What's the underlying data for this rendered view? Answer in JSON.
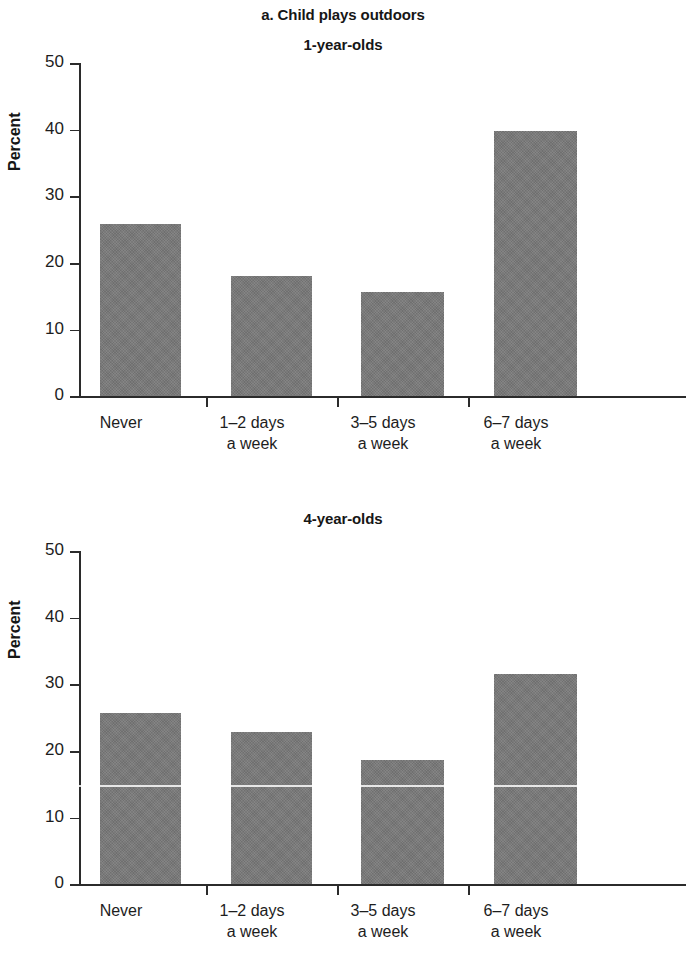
{
  "figure": {
    "title": "a. Child plays outdoors"
  },
  "panels": [
    {
      "title": "1-year-olds",
      "ylabel": "Percent",
      "yticks": [
        "0",
        "10",
        "20",
        "30",
        "40",
        "50"
      ],
      "categories": [
        "Never",
        "1–2 days\na week",
        "3–5 days\na week",
        "6–7 days\na week"
      ],
      "values": [
        25.8,
        18.1,
        15.6,
        39.8
      ]
    },
    {
      "title": "4-year-olds",
      "ylabel": "Percent",
      "yticks": [
        "0",
        "10",
        "20",
        "30",
        "40",
        "50"
      ],
      "categories": [
        "Never",
        "1–2 days\na week",
        "3–5 days\na week",
        "6–7 days\na week"
      ],
      "values": [
        25.7,
        22.8,
        18.6,
        31.6
      ]
    }
  ],
  "chart_data": {
    "type": "bar",
    "title": "a. Child plays outdoors",
    "xlabel": "",
    "ylabel": "Percent",
    "ylim": [
      0,
      50
    ],
    "yticks": [
      0,
      10,
      20,
      30,
      40,
      50
    ],
    "grid": false,
    "legend": "none",
    "categories": [
      "Never",
      "1–2 days a week",
      "3–5 days a week",
      "6–7 days a week"
    ],
    "panels": [
      {
        "subtitle": "1-year-olds",
        "series": [
          {
            "name": "1-year-olds",
            "values": [
              25.8,
              18.1,
              15.6,
              39.8
            ]
          }
        ]
      },
      {
        "subtitle": "4-year-olds",
        "series": [
          {
            "name": "4-year-olds",
            "values": [
              25.7,
              22.8,
              18.6,
              31.6
            ]
          }
        ]
      }
    ],
    "bar_color": "#797979"
  }
}
